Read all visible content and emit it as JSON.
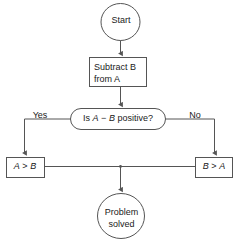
{
  "diagram": {
    "type": "flowchart",
    "stroke_color": "#555555",
    "text_color": "#1a1a1a",
    "background_color": "#ffffff",
    "nodes": {
      "start": {
        "shape": "circle",
        "label": "Start"
      },
      "process": {
        "shape": "rectangle",
        "label": "Subtract B\nfrom A",
        "line1": "Subtract B",
        "line2": "from A"
      },
      "decision": {
        "shape": "stadium",
        "label": "Is A − B positive?",
        "prefix": "Is ",
        "operand_a": "A",
        "operator": " − ",
        "operand_b": "B",
        "suffix": " positive?"
      },
      "result_left": {
        "shape": "rectangle",
        "label": "A > B",
        "operand_a": "A",
        "operator": " > ",
        "operand_b": "B"
      },
      "result_right": {
        "shape": "rectangle",
        "label": "B > A",
        "operand_a": "B",
        "operator": " > ",
        "operand_b": "A"
      },
      "end": {
        "shape": "circle",
        "label": "Problem\nsolved",
        "line1": "Problem",
        "line2": "solved"
      }
    },
    "edge_labels": {
      "yes": "Yes",
      "no": "No"
    },
    "edges": [
      {
        "from": "start",
        "to": "process",
        "label": ""
      },
      {
        "from": "process",
        "to": "decision",
        "label": ""
      },
      {
        "from": "decision",
        "to": "result_left",
        "label": "Yes"
      },
      {
        "from": "decision",
        "to": "result_right",
        "label": "No"
      },
      {
        "from": "result_left",
        "to": "end",
        "label": ""
      },
      {
        "from": "result_right",
        "to": "end",
        "label": ""
      }
    ]
  }
}
